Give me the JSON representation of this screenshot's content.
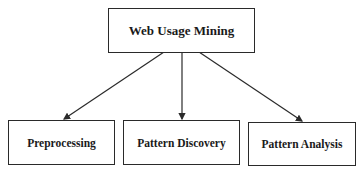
{
  "diagram": {
    "root": {
      "label": "Web Usage Mining"
    },
    "children": [
      {
        "label": "Preprocessing"
      },
      {
        "label": "Pattern Discovery"
      },
      {
        "label": "Pattern Analysis"
      }
    ],
    "colors": {
      "stroke": "#2a2a2a",
      "text": "#1a1a1a",
      "background": "#ffffff"
    }
  }
}
